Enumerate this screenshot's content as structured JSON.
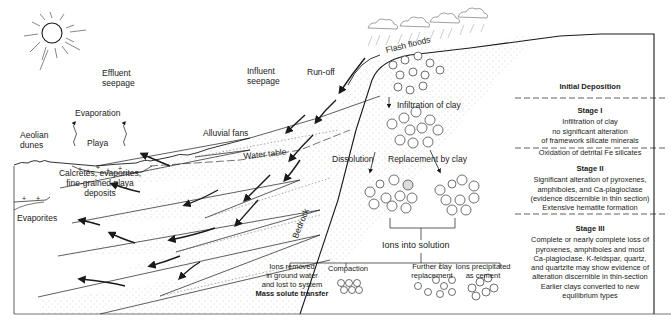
{
  "diagram": {
    "environment_labels": {
      "effluent_seepage": [
        "Effluent",
        "seepage"
      ],
      "influent_seepage": [
        "Influent",
        "seepage"
      ],
      "run_off": "Run-off",
      "flash_floods": "Flash floods",
      "evaporation": "Evaporation",
      "aeolian_dunes": [
        "Aeolian",
        "dunes"
      ],
      "playa": "Playa",
      "alluvial_fans": "Alluvial fans",
      "water_table": "Water table",
      "calcretes": [
        "Calcretes, evaporites,",
        "fine-grained playa",
        "deposits"
      ],
      "evaporites": "Evaporites",
      "bedrock": "Bedrock"
    },
    "process_labels": {
      "infiltration_of_clay": "Infiltration of clay",
      "dissolution": "Dissolution",
      "replacement_by_clay": "Replacement by clay",
      "ions_into_solution": "Ions into solution",
      "ions_removed": [
        "Ions removed",
        "in ground water",
        "and lost to system"
      ],
      "mass_solute_transfer": "Mass solute transfer",
      "compaction": "Compaction",
      "further_clay_replacement": [
        "Further clay",
        "replacement"
      ],
      "ions_precipitated": [
        "Ions precipitated",
        "as cement"
      ]
    },
    "grain_letters": [
      "Q",
      "P",
      "K",
      "H",
      "C"
    ],
    "stages": {
      "initial": {
        "title": "Initial Deposition"
      },
      "stage1": {
        "title": "Stage I",
        "lines": [
          "Infiltration of clay",
          "no significant alteration",
          "of framework silicate minerals",
          "Oxidation of detrital Fe silicates"
        ]
      },
      "stage2": {
        "title": "Stage II",
        "lines": [
          "Significant alteration of pyroxenes,",
          "amphiboles, and Ca-plagioclase",
          "(evidence discernible in thin section)",
          "Extensive hematite formation"
        ]
      },
      "stage3": {
        "title": "Stage III",
        "lines": [
          "Complete or nearly complete loss of",
          "pyroxenes, amphiboles and most",
          "Ca-plagioclase. K-feldspar, quartz,",
          "and quartzite may show evidence of",
          "alteration discernible in thin-section",
          "Earlier clays converted to new",
          "equilibrium types"
        ]
      }
    },
    "colors": {
      "line": "#1a1a1a",
      "stipple": "#9a9a9a",
      "rain": "#8a8a8a",
      "background": "#ffffff"
    }
  }
}
